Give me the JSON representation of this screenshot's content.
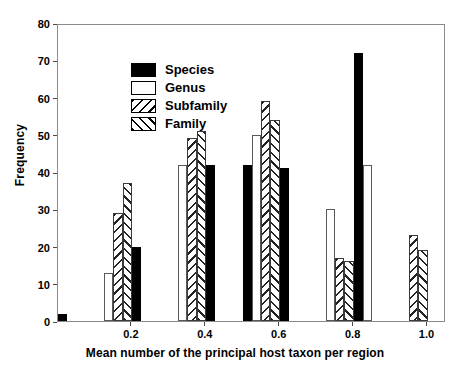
{
  "chart_data": {
    "type": "bar",
    "title": "",
    "xlabel": "Mean number of the principal host taxon per region",
    "ylabel": "Frequency",
    "xlim": [
      0.0,
      1.05
    ],
    "ylim": [
      0,
      80
    ],
    "grid": false,
    "legend_position": "top-left",
    "bin_width": 0.1,
    "bin_starts": [
      0.0,
      0.1,
      0.2,
      0.3,
      0.4,
      0.5,
      0.6,
      0.7,
      0.8,
      0.9
    ],
    "categories": [
      "0.0-0.1",
      "0.1-0.2",
      "0.2-0.3",
      "0.3-0.4",
      "0.4-0.5",
      "0.5-0.6",
      "0.6-0.7",
      "0.7-0.8",
      "0.8-0.9",
      "0.9-1.0"
    ],
    "xticks": [
      0.2,
      0.4,
      0.6,
      0.8,
      1.0
    ],
    "xtick_labels": [
      "0.2",
      "0.4",
      "0.6",
      "0.8",
      "1.0"
    ],
    "yticks": [
      0,
      10,
      20,
      30,
      40,
      50,
      60,
      70,
      80
    ],
    "ytick_labels": [
      "0",
      "10",
      "20",
      "30",
      "40",
      "50",
      "60",
      "70",
      "80"
    ],
    "series": [
      {
        "name": "Species",
        "key": "species",
        "fill": "solid-black",
        "color": "#000000",
        "bars": [
          {
            "bin": "0.0-0.1",
            "x": 0.05,
            "value": 2
          },
          {
            "bin": "0.2-0.3",
            "x": 0.25,
            "value": 20
          },
          {
            "bin": "0.4-0.5",
            "x": 0.45,
            "value": 42
          },
          {
            "bin": "0.5-0.6",
            "x": 0.55,
            "value": 42
          },
          {
            "bin": "0.6-0.7",
            "x": 0.65,
            "value": 41
          },
          {
            "bin": "0.8-0.9",
            "x": 0.85,
            "value": 72
          }
        ]
      },
      {
        "name": "Genus",
        "key": "genus",
        "fill": "open-white",
        "color": "#ffffff",
        "bars": [
          {
            "bin": "0.1-0.2",
            "x": 0.12,
            "value": 13
          },
          {
            "bin": "0.3-0.4",
            "x": 0.32,
            "value": 42
          },
          {
            "bin": "0.5-0.6",
            "x": 0.52,
            "value": 50
          },
          {
            "bin": "0.7-0.8",
            "x": 0.72,
            "value": 30
          },
          {
            "bin": "0.8-0.9",
            "x": 0.88,
            "value": 42
          }
        ]
      },
      {
        "name": "Subfamily",
        "key": "subfamily",
        "fill": "backslash-hatch",
        "color": "#ffffff",
        "bars": [
          {
            "bin": "0.1-0.2",
            "x": 0.16,
            "value": 29
          },
          {
            "bin": "0.3-0.4",
            "x": 0.36,
            "value": 49
          },
          {
            "bin": "0.5-0.6",
            "x": 0.56,
            "value": 59
          },
          {
            "bin": "0.7-0.8",
            "x": 0.75,
            "value": 17
          },
          {
            "bin": "0.9-1.0",
            "x": 0.92,
            "value": 23
          }
        ]
      },
      {
        "name": "Family",
        "key": "family",
        "fill": "forwardslash-hatch",
        "color": "#ffffff",
        "bars": [
          {
            "bin": "0.1-0.2",
            "x": 0.19,
            "value": 37
          },
          {
            "bin": "0.3-0.4",
            "x": 0.39,
            "value": 51
          },
          {
            "bin": "0.5-0.6",
            "x": 0.59,
            "value": 54
          },
          {
            "bin": "0.7-0.8",
            "x": 0.78,
            "value": 16
          },
          {
            "bin": "0.9-1.0",
            "x": 0.95,
            "value": 19
          }
        ]
      }
    ]
  },
  "legend": {
    "items": [
      {
        "label": "Species",
        "key": "species"
      },
      {
        "label": "Genus",
        "key": "genus"
      },
      {
        "label": "Subfamily",
        "key": "subfamily"
      },
      {
        "label": "Family",
        "key": "family"
      }
    ]
  },
  "colors": {
    "species": "#000000",
    "genus": "#ffffff",
    "hatch": "#222222",
    "axis": "#4a4a4a",
    "frame": "#8a8a8a",
    "background": "#ffffff"
  }
}
